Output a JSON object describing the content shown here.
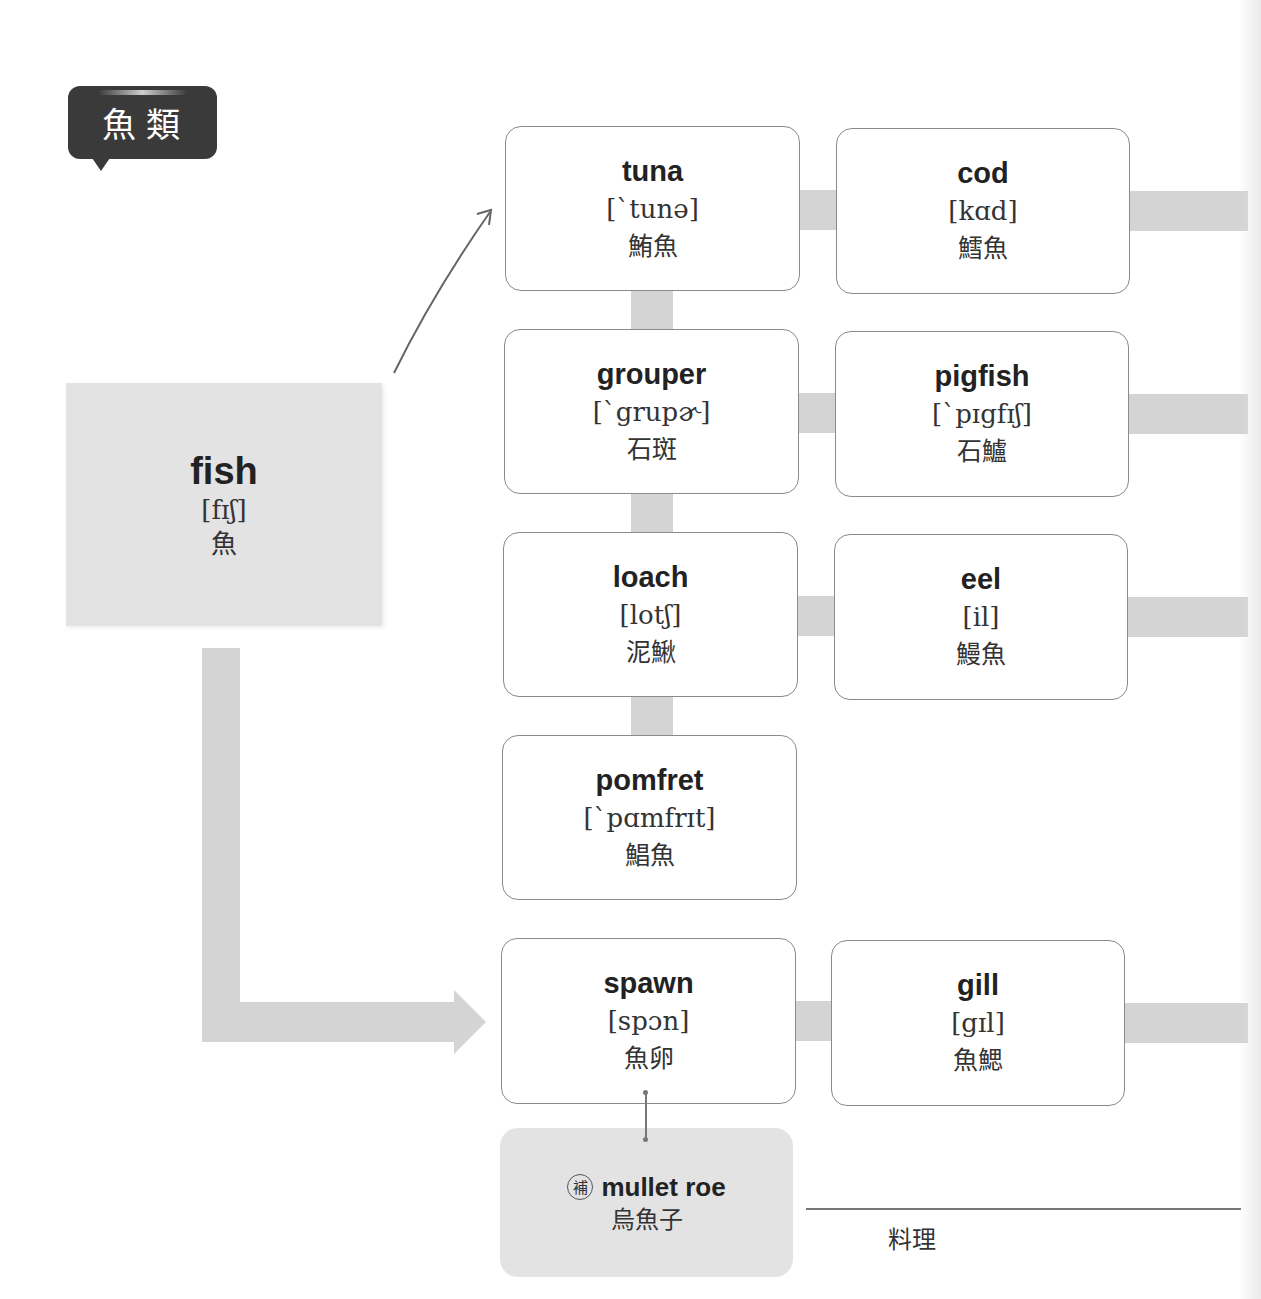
{
  "category_title": "魚類",
  "root": {
    "en": "fish",
    "ipa": "[fɪʃ]",
    "zh": "魚"
  },
  "cards": [
    {
      "id": "tuna",
      "en": "tuna",
      "ipa": "[ˋtunə]",
      "zh": "鮪魚"
    },
    {
      "id": "cod",
      "en": "cod",
      "ipa": "[kɑd]",
      "zh": "鱈魚"
    },
    {
      "id": "grouper",
      "en": "grouper",
      "ipa": "[ˋgrupɚ]",
      "zh": "石斑"
    },
    {
      "id": "pigfish",
      "en": "pigfish",
      "ipa": "[ˋpɪgfɪʃ]",
      "zh": "石鱸"
    },
    {
      "id": "loach",
      "en": "loach",
      "ipa": "[lotʃ]",
      "zh": "泥鰍"
    },
    {
      "id": "eel",
      "en": "eel",
      "ipa": "[il]",
      "zh": "鰻魚"
    },
    {
      "id": "pomfret",
      "en": "pomfret",
      "ipa": "[ˋpɑmfrɪt]",
      "zh": "鯧魚"
    },
    {
      "id": "spawn",
      "en": "spawn",
      "ipa": "[spɔn]",
      "zh": "魚卵"
    },
    {
      "id": "gill",
      "en": "gill",
      "ipa": "[gɪl]",
      "zh": "魚鰓"
    }
  ],
  "supplement": {
    "badge": "補",
    "en": "mullet roe",
    "zh": "烏魚子"
  },
  "next_section": {
    "label": "料理"
  },
  "colors": {
    "bubble": "#3a3a3a",
    "root_bg": "#e3e3e3",
    "connector": "#d4d4d4",
    "card_border": "#8a8a8a"
  }
}
